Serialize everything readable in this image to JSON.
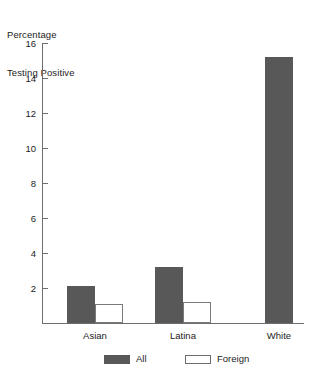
{
  "chart_data": {
    "type": "bar",
    "title": "Percentage Testing Positive",
    "title_lines": [
      "Percentage",
      "Testing Positive"
    ],
    "xlabel": "",
    "ylabel": "",
    "categories": [
      "Asian",
      "Latina",
      "White"
    ],
    "series": [
      {
        "name": "All",
        "color": "#585858",
        "values": [
          2.1,
          3.2,
          15.2
        ]
      },
      {
        "name": "Foreign",
        "color": "#ffffff",
        "values": [
          1.1,
          1.2,
          null
        ]
      }
    ],
    "ylim": [
      0,
      16
    ],
    "yticks": [
      2,
      4,
      6,
      8,
      10,
      12,
      14,
      16
    ],
    "ytick_labels": [
      "2",
      "4",
      "6",
      "8",
      "10",
      "12",
      "14",
      "16"
    ],
    "grid": false,
    "legend": {
      "position": "bottom",
      "entries": [
        {
          "label": "All",
          "swatch": "filled-dark"
        },
        {
          "label": "Foreign",
          "swatch": "outlined-white"
        }
      ]
    }
  },
  "colors": {
    "bar_all": "#585858",
    "bar_foreign": "#ffffff",
    "bar_foreign_border": "#7a7a7a",
    "axis": "#6e6e6e",
    "text": "#1c1c1c",
    "background": "#ffffff"
  }
}
